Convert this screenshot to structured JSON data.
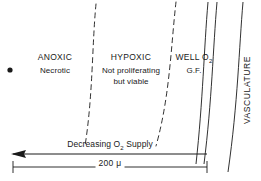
{
  "figure": {
    "background_color": "#ffffff",
    "ink_color": "#1a1a1a",
    "width": 261,
    "height": 181
  },
  "zones": {
    "anoxic": {
      "title": "ANOXIC",
      "subtitle": "Necrotic"
    },
    "hypoxic": {
      "title": "HYPOXIC",
      "subtitle_line1": "Not proliferating",
      "subtitle_line2": "but viable"
    },
    "well_oxygenated": {
      "title_prefix": "WELL O",
      "title_subscript": "2",
      "subtitle": "G.F."
    },
    "vasculature": {
      "label": "VASCULATURE"
    }
  },
  "annotations": {
    "gradient_arrow": {
      "prefix": "Decreasing O",
      "subscript": "2",
      "suffix": " Supply",
      "direction": "left"
    },
    "scale_bar": {
      "value": "200",
      "unit": "μ",
      "label": "200 μ"
    },
    "necrotic_core_marker": "filled-dot"
  }
}
